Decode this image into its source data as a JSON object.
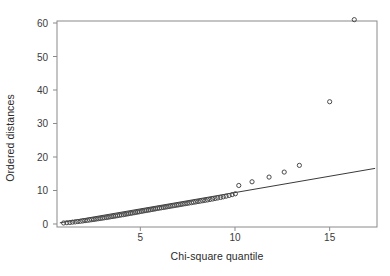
{
  "chart_data": {
    "type": "scatter",
    "title": "",
    "xlabel": "Chi-square quantile",
    "ylabel": "Ordered distances",
    "xlim": [
      0.6,
      17.5
    ],
    "ylim": [
      -0.9,
      60.6
    ],
    "xticks": [
      5,
      10,
      15
    ],
    "yticks": [
      0,
      10,
      20,
      30,
      40,
      50,
      60
    ],
    "grid": false,
    "legend": null,
    "marker": "open-circle",
    "marker_color": "#4a4a4a",
    "line_color": "#3a3a3a",
    "frame_color": "#8a8a8a",
    "reference_line": {
      "label": "identity reference line",
      "x": [
        0.75,
        17.4
      ],
      "y": [
        0.35,
        16.6
      ]
    },
    "points": [
      {
        "x": 0.95,
        "y": 0.3
      },
      {
        "x": 1.12,
        "y": 0.38
      },
      {
        "x": 1.28,
        "y": 0.45
      },
      {
        "x": 1.42,
        "y": 0.55
      },
      {
        "x": 1.56,
        "y": 0.62
      },
      {
        "x": 1.7,
        "y": 0.72
      },
      {
        "x": 1.83,
        "y": 0.8
      },
      {
        "x": 1.96,
        "y": 0.9
      },
      {
        "x": 2.08,
        "y": 1.0
      },
      {
        "x": 2.2,
        "y": 1.08
      },
      {
        "x": 2.32,
        "y": 1.18
      },
      {
        "x": 2.44,
        "y": 1.28
      },
      {
        "x": 2.55,
        "y": 1.36
      },
      {
        "x": 2.66,
        "y": 1.46
      },
      {
        "x": 2.77,
        "y": 1.56
      },
      {
        "x": 2.88,
        "y": 1.64
      },
      {
        "x": 2.99,
        "y": 1.74
      },
      {
        "x": 3.09,
        "y": 1.84
      },
      {
        "x": 3.2,
        "y": 1.92
      },
      {
        "x": 3.3,
        "y": 2.02
      },
      {
        "x": 3.4,
        "y": 2.12
      },
      {
        "x": 3.5,
        "y": 2.22
      },
      {
        "x": 3.6,
        "y": 2.3
      },
      {
        "x": 3.7,
        "y": 2.4
      },
      {
        "x": 3.8,
        "y": 2.5
      },
      {
        "x": 3.9,
        "y": 2.6
      },
      {
        "x": 4.0,
        "y": 2.7
      },
      {
        "x": 4.1,
        "y": 2.78
      },
      {
        "x": 4.19,
        "y": 2.88
      },
      {
        "x": 4.29,
        "y": 2.98
      },
      {
        "x": 4.38,
        "y": 3.08
      },
      {
        "x": 4.48,
        "y": 3.18
      },
      {
        "x": 4.57,
        "y": 3.26
      },
      {
        "x": 4.67,
        "y": 3.36
      },
      {
        "x": 4.76,
        "y": 3.46
      },
      {
        "x": 4.86,
        "y": 3.56
      },
      {
        "x": 4.95,
        "y": 3.66
      },
      {
        "x": 5.05,
        "y": 3.76
      },
      {
        "x": 5.14,
        "y": 3.86
      },
      {
        "x": 5.24,
        "y": 3.96
      },
      {
        "x": 5.33,
        "y": 4.04
      },
      {
        "x": 5.43,
        "y": 4.14
      },
      {
        "x": 5.52,
        "y": 4.24
      },
      {
        "x": 5.62,
        "y": 4.34
      },
      {
        "x": 5.72,
        "y": 4.44
      },
      {
        "x": 5.81,
        "y": 4.54
      },
      {
        "x": 5.91,
        "y": 4.64
      },
      {
        "x": 6.01,
        "y": 4.74
      },
      {
        "x": 6.11,
        "y": 4.84
      },
      {
        "x": 6.21,
        "y": 4.92
      },
      {
        "x": 6.31,
        "y": 5.02
      },
      {
        "x": 6.41,
        "y": 5.12
      },
      {
        "x": 6.51,
        "y": 5.22
      },
      {
        "x": 6.61,
        "y": 5.32
      },
      {
        "x": 6.72,
        "y": 5.42
      },
      {
        "x": 6.82,
        "y": 5.52
      },
      {
        "x": 6.93,
        "y": 5.62
      },
      {
        "x": 7.03,
        "y": 5.72
      },
      {
        "x": 7.14,
        "y": 5.82
      },
      {
        "x": 7.25,
        "y": 5.94
      },
      {
        "x": 7.36,
        "y": 6.04
      },
      {
        "x": 7.47,
        "y": 6.14
      },
      {
        "x": 7.58,
        "y": 6.26
      },
      {
        "x": 7.7,
        "y": 6.36
      },
      {
        "x": 7.81,
        "y": 6.48
      },
      {
        "x": 7.93,
        "y": 6.58
      },
      {
        "x": 8.05,
        "y": 6.7
      },
      {
        "x": 8.17,
        "y": 6.82
      },
      {
        "x": 8.3,
        "y": 6.94
      },
      {
        "x": 8.42,
        "y": 7.06
      },
      {
        "x": 8.55,
        "y": 7.18
      },
      {
        "x": 8.68,
        "y": 7.32
      },
      {
        "x": 8.82,
        "y": 7.46
      },
      {
        "x": 8.95,
        "y": 7.6
      },
      {
        "x": 9.09,
        "y": 7.76
      },
      {
        "x": 9.24,
        "y": 7.92
      },
      {
        "x": 9.38,
        "y": 8.1
      },
      {
        "x": 9.53,
        "y": 8.3
      },
      {
        "x": 9.69,
        "y": 8.52
      },
      {
        "x": 9.85,
        "y": 8.76
      },
      {
        "x": 10.02,
        "y": 9.02
      },
      {
        "x": 10.2,
        "y": 11.5
      },
      {
        "x": 10.9,
        "y": 12.6
      },
      {
        "x": 11.8,
        "y": 14.0
      },
      {
        "x": 12.6,
        "y": 15.5
      },
      {
        "x": 13.4,
        "y": 17.5
      },
      {
        "x": 15.0,
        "y": 36.5
      },
      {
        "x": 16.3,
        "y": 61.0
      }
    ]
  }
}
